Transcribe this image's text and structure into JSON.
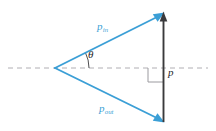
{
  "figure": {
    "kind": "vector-diagram",
    "title_visible": false,
    "background_color": "#ffffff",
    "width": 216,
    "height": 131
  },
  "colors": {
    "vector_blue": "#3b9fd6",
    "vector_blue_light": "#5fb4e0",
    "momentum_dark": "#3a3a3c",
    "axis_dashed_gray": "#b0aeb3",
    "right_angle_gray": "#9b9a9f",
    "label_dark": "#27272a"
  },
  "labels": {
    "p_in": {
      "base": "p",
      "sub": "in",
      "x": 97,
      "y": 21
    },
    "p_out": {
      "base": "p",
      "sub": "out",
      "x": 99,
      "y": 103
    },
    "theta": {
      "text": "θ",
      "x": 88,
      "y": 49
    },
    "p": {
      "text": "p",
      "x": 168,
      "y": 67
    }
  },
  "geometry": {
    "origin": {
      "x": 55,
      "y": 68
    },
    "top_point": {
      "x": 163,
      "y": 13
    },
    "bottom_point": {
      "x": 163,
      "y": 122
    },
    "axis_line": {
      "x1": 8,
      "y1": 68,
      "x2": 208,
      "y2": 68
    },
    "dash_pattern": "5 4",
    "angle_arc": {
      "cx": 55,
      "cy": 68,
      "radius": 34,
      "start_deg": 0,
      "end_deg": 27
    },
    "right_angle_marker": {
      "x": 148,
      "y": 68,
      "size": 14
    }
  },
  "vectors": [
    {
      "name": "p_in",
      "from": "origin",
      "to": "top_point",
      "color": "#3b9fd6",
      "arrow_at": "to"
    },
    {
      "name": "p_out",
      "from": "origin",
      "to": "bottom_point",
      "color": "#3b9fd6",
      "arrow_at": "to"
    },
    {
      "name": "p",
      "from": "bottom_point",
      "to": "top_point",
      "color": "#3a3a3c",
      "arrow_at": "to"
    }
  ]
}
